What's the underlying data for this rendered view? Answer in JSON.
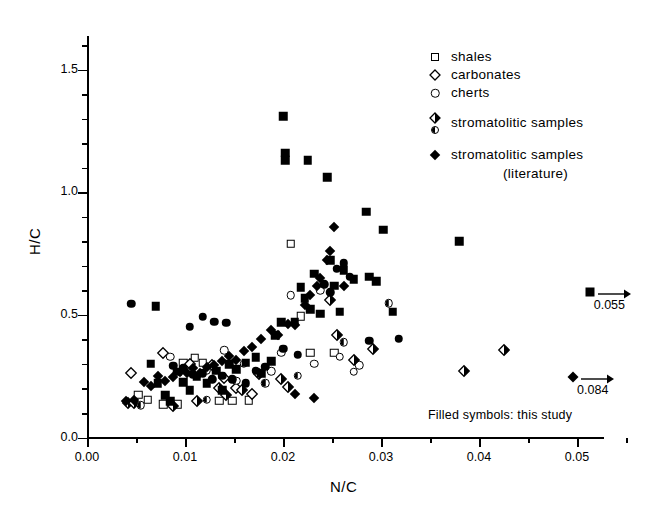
{
  "figure": {
    "background": "#ffffff",
    "ink": "#000000"
  },
  "axes": {
    "x": {
      "label": "N/C",
      "min": 0.0,
      "max": 0.0555,
      "major_ticks": [
        0.0,
        0.01,
        0.02,
        0.03,
        0.04,
        0.05
      ],
      "major_tick_labels": [
        "0.00",
        "0.01",
        "0.02",
        "0.03",
        "0.04",
        "0.05"
      ],
      "minor_tick_step": 0.005
    },
    "y": {
      "label": "H/C",
      "min": 0.0,
      "max": 1.63,
      "major_ticks": [
        0.0,
        0.5,
        1.0,
        1.5
      ],
      "major_tick_labels": [
        "0.0",
        "0.5",
        "1.0",
        "1.5"
      ],
      "minor_tick_step": 0.1
    }
  },
  "legend": {
    "position": "top-right-inside",
    "entries": [
      {
        "symbols": [
          "square-open"
        ],
        "label": "shales"
      },
      {
        "symbols": [
          "diamond-open"
        ],
        "label": "carbonates"
      },
      {
        "symbols": [
          "circle-open"
        ],
        "label": "cherts"
      },
      {
        "symbols": [
          "diamond-half",
          "circle-half"
        ],
        "label": "stromatolitic samples"
      },
      {
        "symbols": [
          "diamond-filled"
        ],
        "label": "stromatolitic samples"
      }
    ],
    "continuation_line": "(literature)"
  },
  "note": "Filled symbols: this study",
  "offscale_annotations": [
    {
      "symbol": "square-filled",
      "x_plot": 0.0513,
      "y": 0.595,
      "value": "0.055",
      "arrow": "right"
    },
    {
      "symbol": "diamond-filled",
      "x_plot": 0.0496,
      "y": 0.245,
      "value": "0.084",
      "arrow": "right"
    }
  ],
  "chart_data": {
    "type": "scatter",
    "title": "",
    "xlabel": "N/C",
    "ylabel": "H/C",
    "xlim": [
      0.0,
      0.0555
    ],
    "ylim": [
      0.0,
      1.63
    ],
    "grid": false,
    "legend_position": "upper right",
    "annotations": [
      "Filled symbols: this study",
      "0.055",
      "0.084"
    ],
    "series": [
      {
        "name": "shales",
        "marker": "square-open",
        "fill": "open",
        "points": [
          [
            0.0052,
            0.175
          ],
          [
            0.0062,
            0.155
          ],
          [
            0.0078,
            0.135
          ],
          [
            0.0092,
            0.135
          ],
          [
            0.0098,
            0.305
          ],
          [
            0.011,
            0.325
          ],
          [
            0.0118,
            0.305
          ],
          [
            0.0135,
            0.15
          ],
          [
            0.0148,
            0.15
          ],
          [
            0.0165,
            0.152
          ],
          [
            0.0208,
            0.79
          ],
          [
            0.0218,
            0.495
          ],
          [
            0.0228,
            0.345
          ],
          [
            0.0252,
            0.345
          ]
        ]
      },
      {
        "name": "carbonates",
        "marker": "diamond-open",
        "fill": "open",
        "points": [
          [
            0.0045,
            0.265
          ],
          [
            0.0078,
            0.345
          ],
          [
            0.0105,
            0.3
          ],
          [
            0.0128,
            0.295
          ],
          [
            0.014,
            0.242
          ],
          [
            0.0152,
            0.2
          ],
          [
            0.0168,
            0.178
          ]
        ]
      },
      {
        "name": "cherts",
        "marker": "circle-open",
        "fill": "open",
        "points": [
          [
            0.0085,
            0.33
          ],
          [
            0.0122,
            0.275
          ],
          [
            0.014,
            0.355
          ],
          [
            0.016,
            0.3
          ],
          [
            0.0188,
            0.27
          ],
          [
            0.0198,
            0.345
          ],
          [
            0.0208,
            0.58
          ],
          [
            0.0232,
            0.3
          ],
          [
            0.0238,
            0.6
          ],
          [
            0.0258,
            0.33
          ],
          [
            0.0272,
            0.268
          ],
          [
            0.0278,
            0.295
          ]
        ]
      },
      {
        "name": "stromatolitic samples (half-filled)",
        "marker": "diamond-half / circle-half",
        "fill": "half",
        "points": [
          [
            0.0042,
            0.14
          ],
          [
            0.0048,
            0.14
          ],
          [
            0.0055,
            0.132
          ],
          [
            0.0088,
            0.13
          ],
          [
            0.0112,
            0.148
          ],
          [
            0.0122,
            0.155
          ],
          [
            0.0135,
            0.2
          ],
          [
            0.0142,
            0.175
          ],
          [
            0.0152,
            0.232
          ],
          [
            0.0158,
            0.195
          ],
          [
            0.0175,
            0.26
          ],
          [
            0.0182,
            0.222
          ],
          [
            0.0198,
            0.24
          ],
          [
            0.0205,
            0.208
          ],
          [
            0.0215,
            0.252
          ],
          [
            0.0248,
            0.56
          ],
          [
            0.0255,
            0.418
          ],
          [
            0.0262,
            0.388
          ],
          [
            0.0272,
            0.315
          ],
          [
            0.0292,
            0.362
          ],
          [
            0.0308,
            0.548
          ],
          [
            0.0385,
            0.272
          ],
          [
            0.0425,
            0.358
          ]
        ]
      },
      {
        "name": "stromatolitic samples (literature, filled diamonds)",
        "marker": "diamond-filled",
        "fill": "filled",
        "points": [
          [
            0.004,
            0.148
          ],
          [
            0.0048,
            0.152
          ],
          [
            0.0058,
            0.225
          ],
          [
            0.0065,
            0.212
          ],
          [
            0.0072,
            0.252
          ],
          [
            0.008,
            0.232
          ],
          [
            0.0088,
            0.245
          ],
          [
            0.0095,
            0.268
          ],
          [
            0.0102,
            0.262
          ],
          [
            0.0108,
            0.282
          ],
          [
            0.0115,
            0.265
          ],
          [
            0.0122,
            0.288
          ],
          [
            0.013,
            0.295
          ],
          [
            0.0138,
            0.312
          ],
          [
            0.0145,
            0.332
          ],
          [
            0.0152,
            0.318
          ],
          [
            0.016,
            0.352
          ],
          [
            0.0168,
            0.368
          ],
          [
            0.0178,
            0.402
          ],
          [
            0.0188,
            0.438
          ],
          [
            0.0195,
            0.42
          ],
          [
            0.0205,
            0.462
          ],
          [
            0.0212,
            0.458
          ],
          [
            0.0222,
            0.54
          ],
          [
            0.0228,
            0.582
          ],
          [
            0.0235,
            0.618
          ],
          [
            0.0238,
            0.652
          ],
          [
            0.0245,
            0.722
          ],
          [
            0.0248,
            0.76
          ],
          [
            0.0252,
            0.858
          ],
          [
            0.0262,
            0.618
          ],
          [
            0.0212,
            0.178
          ],
          [
            0.0232,
            0.16
          ]
        ]
      },
      {
        "name": "filled squares (this study)",
        "marker": "square-filled",
        "fill": "filled",
        "points": [
          [
            0.007,
            0.535
          ],
          [
            0.0065,
            0.3
          ],
          [
            0.0072,
            0.222
          ],
          [
            0.008,
            0.172
          ],
          [
            0.0085,
            0.148
          ],
          [
            0.0092,
            0.268
          ],
          [
            0.0098,
            0.225
          ],
          [
            0.0105,
            0.192
          ],
          [
            0.0112,
            0.248
          ],
          [
            0.0122,
            0.222
          ],
          [
            0.0132,
            0.272
          ],
          [
            0.0138,
            0.192
          ],
          [
            0.0145,
            0.298
          ],
          [
            0.0152,
            0.278
          ],
          [
            0.0162,
            0.305
          ],
          [
            0.0172,
            0.328
          ],
          [
            0.0178,
            0.262
          ],
          [
            0.0188,
            0.312
          ],
          [
            0.0192,
            0.418
          ],
          [
            0.0198,
            0.47
          ],
          [
            0.02,
            1.31
          ],
          [
            0.0202,
            1.16
          ],
          [
            0.0202,
            1.13
          ],
          [
            0.0225,
            1.13
          ],
          [
            0.0212,
            0.472
          ],
          [
            0.0218,
            0.612
          ],
          [
            0.0222,
            0.568
          ],
          [
            0.0228,
            0.522
          ],
          [
            0.0232,
            0.668
          ],
          [
            0.0238,
            0.505
          ],
          [
            0.0245,
            1.06
          ],
          [
            0.0248,
            0.722
          ],
          [
            0.0252,
            0.618
          ],
          [
            0.0258,
            0.512
          ],
          [
            0.0262,
            0.682
          ],
          [
            0.0272,
            0.645
          ],
          [
            0.0285,
            0.92
          ],
          [
            0.0288,
            0.655
          ],
          [
            0.0295,
            0.638
          ],
          [
            0.0302,
            0.848
          ],
          [
            0.0312,
            0.512
          ],
          [
            0.038,
            0.8
          ]
        ]
      },
      {
        "name": "filled circles (this study)",
        "marker": "circle-filled",
        "fill": "filled",
        "points": [
          [
            0.0045,
            0.545
          ],
          [
            0.0105,
            0.452
          ],
          [
            0.0118,
            0.492
          ],
          [
            0.013,
            0.472
          ],
          [
            0.0142,
            0.468
          ],
          [
            0.0088,
            0.292
          ],
          [
            0.0098,
            0.282
          ],
          [
            0.0108,
            0.258
          ],
          [
            0.0118,
            0.262
          ],
          [
            0.0128,
            0.238
          ],
          [
            0.0138,
            0.252
          ],
          [
            0.0148,
            0.238
          ],
          [
            0.0162,
            0.222
          ],
          [
            0.0172,
            0.272
          ],
          [
            0.0182,
            0.288
          ],
          [
            0.02,
            0.362
          ],
          [
            0.0215,
            0.338
          ],
          [
            0.0242,
            0.625
          ],
          [
            0.0248,
            0.592
          ],
          [
            0.0255,
            0.688
          ],
          [
            0.0262,
            0.71
          ],
          [
            0.0268,
            0.655
          ],
          [
            0.0288,
            0.395
          ],
          [
            0.0318,
            0.402
          ]
        ]
      }
    ]
  }
}
